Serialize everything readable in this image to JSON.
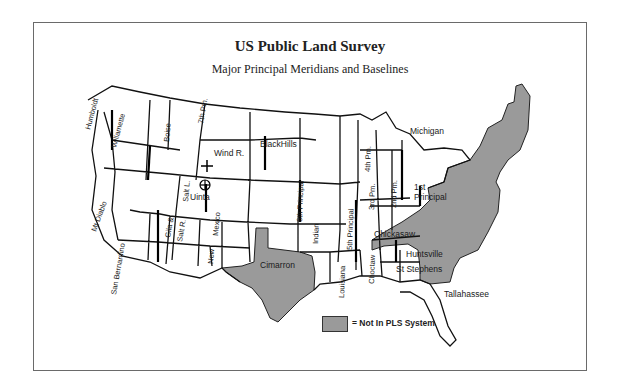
{
  "header": {
    "title": "US Public Land Survey",
    "subtitle": "Major Principal Meridians and Baselines"
  },
  "colors": {
    "frame": "#6a6a6a",
    "non_pls_fill": "#9a9a9a",
    "state_line": "#111111",
    "land": "#ffffff"
  },
  "meridian_labels": {
    "humboldt": "Humboldt",
    "willamette": "Willamette",
    "boise": "Boise",
    "seventh_pm": "7th Pm.",
    "wind_river": "Wind R.",
    "black_hills": "BlackHills",
    "mt_diablo": "Mt Diablo",
    "san_bernardino": "San Bernardino",
    "gila_salt": "Gila &",
    "salt_river": "Salt R.",
    "salt_lake": "Salt L.",
    "uinta": "Uinta",
    "new_mexico_1": "New",
    "new_mexico_2": "Mexico",
    "cimarron": "Cimarron",
    "sixth_principal": "6th Principal",
    "indian": "Indian",
    "fifth_principal": "5th Principal",
    "louisiana": "Louisiana",
    "choctaw": "Choctaw",
    "fourth_pm": "4th Pm.",
    "third_pm": "3rd Pm.",
    "second_pm": "2nd Pm.",
    "michigan": "Michigan",
    "first_principal_1": "1st",
    "first_principal_2": "Principal",
    "chickasaw": "Chickasaw",
    "huntsville": "Huntsville",
    "st_stephens": "St Stephens",
    "tallahassee": "Tallahassee"
  },
  "legend": {
    "label": "= Not In PLS System"
  }
}
